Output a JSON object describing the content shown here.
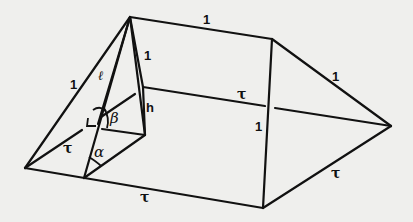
{
  "diagram": {
    "type": "geometric-solid",
    "labels": {
      "top_edge": "1",
      "left_slant_edge": "1",
      "slant_height": "ℓ",
      "apex_edge": "1",
      "height": "h",
      "angle_beta": "β",
      "angle_alpha": "α",
      "left_base": "τ",
      "bottom_edge": "τ",
      "middle_edge": "τ",
      "vertical_edge": "1",
      "right_upper_edge": "1",
      "right_lower_edge": "τ"
    },
    "colors": {
      "line": "#111111",
      "background": "#efefed"
    }
  }
}
